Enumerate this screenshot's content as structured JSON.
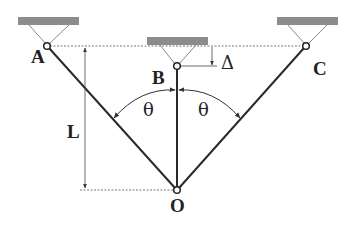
{
  "diagram": {
    "type": "three-bar pendulum/truss system",
    "labels": {
      "pivot_a": "A",
      "pivot_b": "B",
      "pivot_c": "C",
      "joint_o": "O",
      "length": "L",
      "offset": "Δ",
      "angle_left": "θ",
      "angle_right": "θ"
    },
    "colors": {
      "line": "#2a2a2a",
      "support": "#8c8c8c",
      "dashed": "#555555",
      "background": "#ffffff"
    }
  }
}
